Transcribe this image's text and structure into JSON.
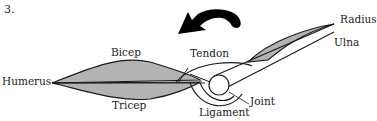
{
  "question_number": "3.",
  "labels": {
    "bicep": "Bicep",
    "tricep": "Tricep",
    "humerus": "Humerus",
    "tendon": "Tendon",
    "radius": "Radius",
    "ulna": "Ulna",
    "joint": "Joint",
    "ligament": "Ligament"
  },
  "colors": {
    "muscle_fill": "#b3b3b3",
    "stroke": "#1a1a1a",
    "arrow": "#000000"
  }
}
